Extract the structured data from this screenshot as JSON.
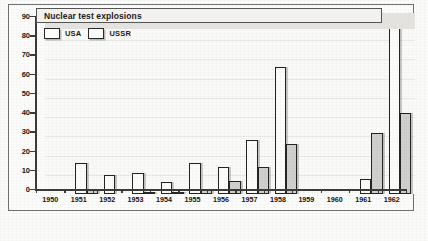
{
  "chart_data": {
    "type": "bar",
    "title": "Nuclear test explosions",
    "xlabel": "",
    "ylabel": "",
    "ylim": [
      0,
      90
    ],
    "yticks": [
      0,
      10,
      20,
      30,
      40,
      50,
      60,
      70,
      80,
      90
    ],
    "grid": true,
    "legend_position": "top-left",
    "categories": [
      "1950",
      "1951",
      "1952",
      "1953",
      "1954",
      "1955",
      "1956",
      "1957",
      "1958",
      "1959",
      "1960",
      "1961",
      "1962"
    ],
    "series": [
      {
        "name": "USA",
        "color": "#fcfcfa",
        "values": [
          0,
          16,
          10,
          11,
          6,
          16,
          14,
          28,
          66,
          0,
          0,
          8,
          96
        ]
      },
      {
        "name": "USSR",
        "color": "#cfcfcb",
        "values": [
          0,
          2,
          0,
          1,
          1,
          2,
          7,
          14,
          26,
          0,
          0,
          32,
          42
        ]
      }
    ]
  },
  "legend": {
    "items": [
      {
        "label": "USA"
      },
      {
        "label": "USSR"
      }
    ]
  },
  "colors": {
    "axis": "#3a3a3a",
    "bar_outline": "#232323",
    "title_bar_bg": "#f2f1ef",
    "plot_bg": "#fafaf8"
  }
}
